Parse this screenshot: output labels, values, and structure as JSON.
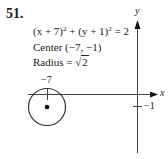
{
  "problem": {
    "number": "51.",
    "equation": {
      "part1": "(x + 7)",
      "exp1": "2",
      "plus": " + (y + 1)",
      "exp2": "2",
      "rhs": " = 2"
    },
    "center_label": "Center (−7, −1)",
    "radius_label": "Radius = ",
    "radius_sqrt_symbol": "√",
    "radius_sqrt_value": "2"
  },
  "graph": {
    "x_axis_label": "x",
    "y_axis_label": "y",
    "x_tick_label": "−7",
    "y_tick_label": "−1",
    "circle": {
      "center": [
        -7,
        -1
      ],
      "radius": "√2"
    }
  }
}
